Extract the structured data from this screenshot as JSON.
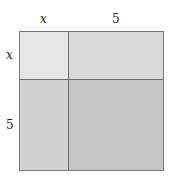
{
  "diagram": {
    "top_labels": [
      "x",
      "5"
    ],
    "side_labels": [
      "x",
      "5"
    ],
    "regions": [
      {
        "name": "x-by-x",
        "color": "#e6e6e6"
      },
      {
        "name": "5-by-x-top",
        "color": "#d9d9d9"
      },
      {
        "name": "x-by-5-bottom",
        "color": "#d2d2d2"
      },
      {
        "name": "5-by-5",
        "color": "#c6c6c6"
      }
    ]
  }
}
